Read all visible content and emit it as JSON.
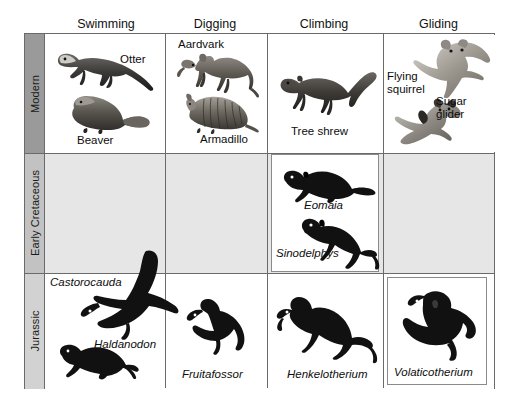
{
  "figure": {
    "type": "comparative-matrix",
    "columns": [
      {
        "id": "swimming",
        "label": "Swimming"
      },
      {
        "id": "digging",
        "label": "Digging"
      },
      {
        "id": "climbing",
        "label": "Climbing"
      },
      {
        "id": "gliding",
        "label": "Gliding"
      }
    ],
    "rows": [
      {
        "id": "modern",
        "label": "Modern",
        "band_color": "#9a9a9a"
      },
      {
        "id": "cretaceous",
        "label": "Early Cretaceous",
        "band_color": "#c2c2c2"
      },
      {
        "id": "jurassic",
        "label": "Jurassic",
        "band_color": "#d2d2d2"
      }
    ],
    "cells": {
      "modern_swimming": {
        "taxa": [
          {
            "name": "Otter",
            "style": "roman"
          },
          {
            "name": "Beaver",
            "style": "roman"
          }
        ]
      },
      "modern_digging": {
        "taxa": [
          {
            "name": "Aardvark",
            "style": "roman"
          },
          {
            "name": "Armadillo",
            "style": "roman"
          }
        ]
      },
      "modern_climbing": {
        "taxa": [
          {
            "name": "Tree shrew",
            "style": "roman"
          }
        ]
      },
      "modern_gliding": {
        "taxa": [
          {
            "name": "Flying\nsquirrel",
            "style": "roman"
          },
          {
            "name": "Sugar\nglider",
            "style": "roman"
          }
        ]
      },
      "cretaceous_swimming": {
        "taxa": []
      },
      "cretaceous_digging": {
        "taxa": []
      },
      "cretaceous_climbing": {
        "taxa": [
          {
            "name": "Eomaia",
            "style": "italic"
          },
          {
            "name": "Sinodelphys",
            "style": "italic"
          }
        ]
      },
      "cretaceous_gliding": {
        "taxa": []
      },
      "jurassic_swimming": {
        "taxa": [
          {
            "name": "Castorocauda",
            "style": "italic"
          },
          {
            "name": "Haldanodon",
            "style": "italic"
          }
        ]
      },
      "jurassic_digging": {
        "taxa": [
          {
            "name": "Fruitafossor",
            "style": "italic"
          }
        ]
      },
      "jurassic_climbing": {
        "taxa": [
          {
            "name": "Henkelotherium",
            "style": "italic"
          }
        ]
      },
      "jurassic_gliding": {
        "taxa": [
          {
            "name": "Volaticotherium",
            "style": "italic"
          }
        ]
      }
    }
  }
}
